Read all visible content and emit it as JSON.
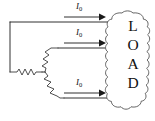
{
  "figure": {
    "type": "circuit-diagram",
    "background_color": "#ffffff",
    "line_color": "#1a1a1a"
  },
  "load_block": {
    "shape": "cloud-blob",
    "label": "LOAD",
    "letters": [
      "L",
      "O",
      "A",
      "D"
    ],
    "orientation": "vertical-stack"
  },
  "current_labels": [
    {
      "id": "top",
      "symbol": "I",
      "subscript": "0",
      "text": "I0"
    },
    {
      "id": "middle",
      "symbol": "I",
      "subscript": "0",
      "text": "I0"
    },
    {
      "id": "bottom",
      "symbol": "I",
      "subscript": "0",
      "text": "I0"
    }
  ],
  "arrows": [
    {
      "id": "arrow-top",
      "direction": "right"
    },
    {
      "id": "arrow-middle",
      "direction": "right"
    },
    {
      "id": "arrow-bottom",
      "direction": "right"
    }
  ],
  "windings": [
    {
      "id": "winding-upper",
      "symbol": "coil-zigzag"
    },
    {
      "id": "winding-middle",
      "symbol": "coil-zigzag"
    },
    {
      "id": "winding-lower",
      "symbol": "coil-zigzag"
    }
  ]
}
